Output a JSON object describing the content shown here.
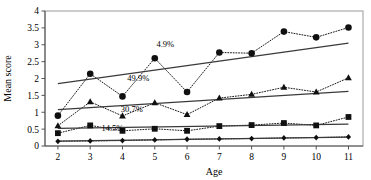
{
  "chart_data": {
    "type": "line",
    "title": "",
    "xlabel": "Age",
    "ylabel": "Mean score",
    "x": [
      2,
      3,
      4,
      5,
      6,
      7,
      8,
      9,
      10,
      11
    ],
    "xtick_labels": [
      "2",
      "3",
      "4",
      "5",
      "6",
      "7",
      "8",
      "9",
      "10",
      "11"
    ],
    "ytick_labels": [
      "0",
      "0.5",
      "1",
      "1.5",
      "2",
      "2.5",
      "3",
      "3.5",
      "4"
    ],
    "ytick_values": [
      0,
      0.5,
      1,
      1.5,
      2,
      2.5,
      3,
      3.5,
      4
    ],
    "xlim": [
      1.6,
      11.45
    ],
    "ylim": [
      0,
      4
    ],
    "grid": false,
    "legend_position": "none",
    "series": [
      {
        "name": "circle-series",
        "marker": "circle",
        "linestyle": "dotted",
        "annotation": "4.9%",
        "values": [
          0.9,
          2.14,
          1.47,
          2.6,
          1.6,
          2.77,
          2.75,
          3.39,
          3.22,
          3.51
        ],
        "trend": {
          "x0": 2,
          "y0": 1.85,
          "x1": 11,
          "y1": 3.05
        }
      },
      {
        "name": "triangle-series",
        "marker": "triangle",
        "linestyle": "dotted",
        "annotation": "49.9%",
        "values": [
          0.6,
          1.31,
          0.89,
          1.28,
          0.93,
          1.42,
          1.53,
          1.74,
          1.6,
          2.02
        ],
        "trend": {
          "x0": 2,
          "y0": 1.08,
          "x1": 11,
          "y1": 1.62
        }
      },
      {
        "name": "square-series",
        "marker": "square",
        "linestyle": "dotted",
        "annotation": "30.7%",
        "values": [
          0.38,
          0.61,
          0.45,
          0.51,
          0.45,
          0.59,
          0.62,
          0.68,
          0.61,
          0.86
        ],
        "trend": {
          "x0": 2,
          "y0": 0.52,
          "x1": 11,
          "y1": 0.65
        }
      },
      {
        "name": "diamond-series",
        "marker": "diamond",
        "linestyle": "dotted",
        "annotation": "14.5%",
        "values": [
          0.14,
          0.15,
          0.16,
          0.18,
          0.2,
          0.21,
          0.22,
          0.24,
          0.25,
          0.27
        ],
        "trend": {
          "x0": 2,
          "y0": 0.145,
          "x1": 11,
          "y1": 0.265
        }
      }
    ],
    "annotations": [
      {
        "text": "4.9%",
        "x": 5.05,
        "y": 2.93,
        "series": "circle-series"
      },
      {
        "text": "49.9%",
        "x": 4.15,
        "y": 1.92,
        "series": "triangle-series"
      },
      {
        "text": "30.7%",
        "x": 3.95,
        "y": 1.01,
        "series": "square-series"
      },
      {
        "text": "14.5%",
        "x": 3.35,
        "y": 0.44,
        "series": "diamond-series"
      }
    ]
  },
  "colors": {
    "marker": "#101010",
    "trend": "#3a3a3a",
    "dotted": "#1a1a1a",
    "frame": "#9a9a9a",
    "axis": "#555555",
    "background": "#ffffff"
  }
}
